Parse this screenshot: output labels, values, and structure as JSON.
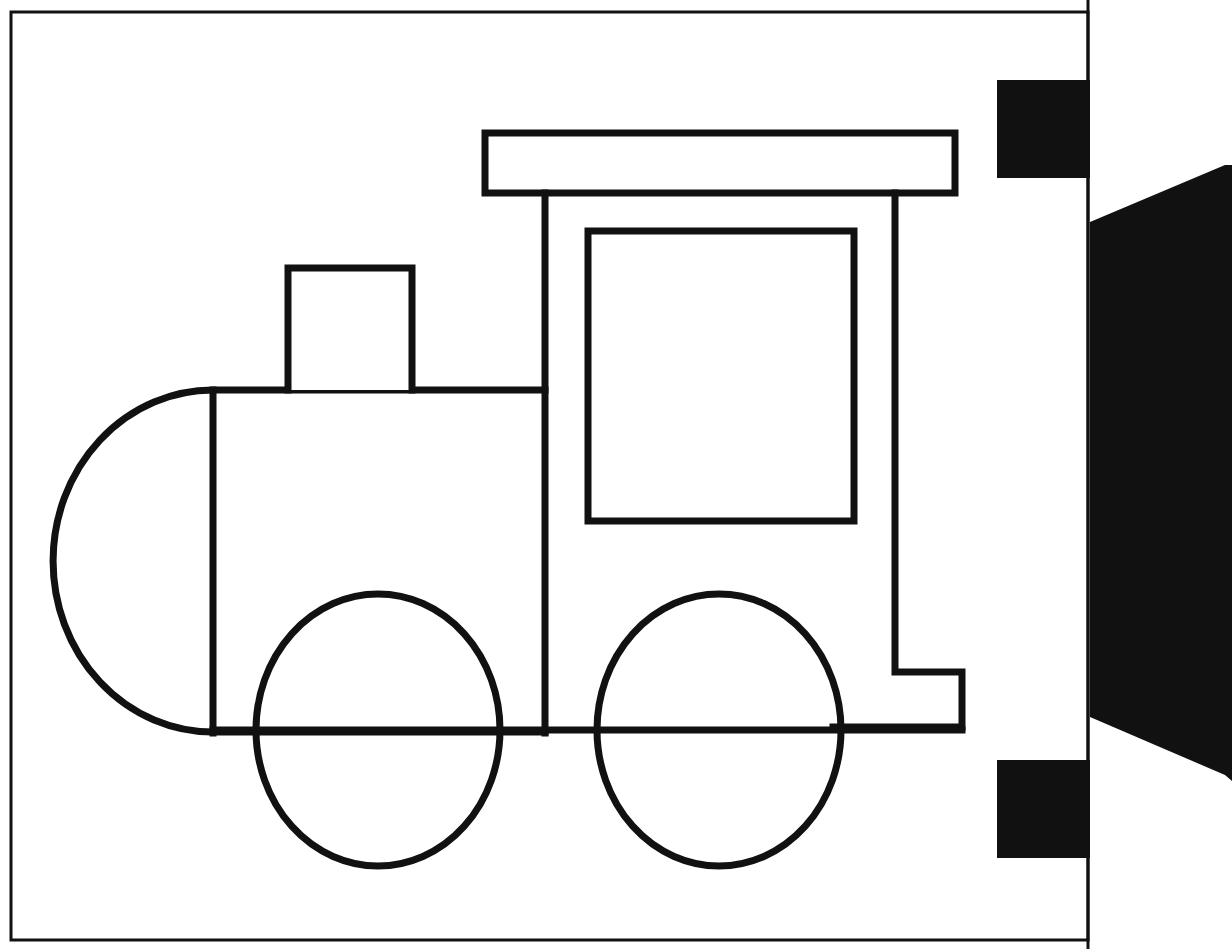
{
  "document": {
    "title": "Train Locomotive Coloring Page",
    "kind": "line-art-drawing",
    "background_color": "#ffffff",
    "stroke_color": "#111111",
    "fill_color": "#ffffff",
    "solid_black": "#111111",
    "canvas": {
      "width": 1232,
      "height": 949
    }
  },
  "page_border": {
    "name": "page-border",
    "x": 11,
    "y": 12,
    "width": 1077,
    "height": 928,
    "stroke_width": 3,
    "color": "#111111"
  },
  "scan_edge": {
    "label": "scanned page edge artifacts",
    "vertical_rule": {
      "x": 1088,
      "y1": 0,
      "y2": 949,
      "stroke_width": 3
    },
    "black_block_top": {
      "x": 997,
      "y": 80,
      "width": 93,
      "height": 98
    },
    "black_block_bottom": {
      "x": 997,
      "y": 760,
      "width": 93,
      "height": 98
    },
    "black_wedge": {
      "points": "1090,222 1225,165 1232,165 1232,781 1225,775 1090,717",
      "note": "angled dark binding shadow along right margin"
    }
  },
  "locomotive": {
    "name": "steam-locomotive",
    "stroke_width": 7,
    "parts": [
      {
        "name": "cab-roof",
        "shape": "rect",
        "x": 485,
        "y": 133,
        "width": 470,
        "height": 60
      },
      {
        "name": "cab-post-left",
        "shape": "line",
        "x": 545,
        "y1": 193,
        "y2": 733
      },
      {
        "name": "cab-post-right",
        "shape": "line",
        "x": 895,
        "y1": 193,
        "y2": 672
      },
      {
        "name": "cab-window",
        "shape": "rect",
        "x": 588,
        "y": 231,
        "width": 266,
        "height": 290
      },
      {
        "name": "cab-rear-step",
        "shape": "polyline",
        "points": "895,672 962,672 962,727 833,727"
      },
      {
        "name": "boiler-body",
        "shape": "rect-open",
        "x": 213,
        "y": 390,
        "width": 332,
        "height": 342
      },
      {
        "name": "smokebox-front",
        "shape": "ellipse-half",
        "cx": 213,
        "cy": 561,
        "rx": 160,
        "ry": 171
      },
      {
        "name": "smokebox-seam",
        "shape": "line",
        "x": 213,
        "y1": 390,
        "y2": 733
      },
      {
        "name": "chimney",
        "shape": "rect-open-bottom",
        "x": 288,
        "y": 268,
        "width": 124,
        "height": 122
      },
      {
        "name": "frame-rail",
        "shape": "line",
        "y": 730,
        "x1": 213,
        "x2": 962
      },
      {
        "name": "wheel-front",
        "shape": "ellipse",
        "cx": 378,
        "cy": 730,
        "rx": 122,
        "ry": 136
      },
      {
        "name": "wheel-rear",
        "shape": "ellipse",
        "cx": 719,
        "cy": 730,
        "rx": 122,
        "ry": 136
      }
    ]
  },
  "alt_text": "Black outline drawing of a cartoon steam train locomotive with a rounded boiler front, a square chimney, a cab with a large window and flat roof, two large oval wheels, and a rear step, drawn inside a thin rectangular page border."
}
